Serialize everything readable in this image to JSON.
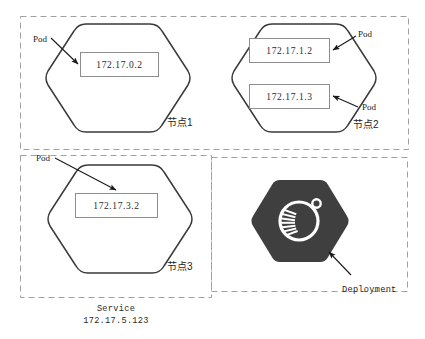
{
  "figure": {
    "title_clipped": "",
    "background_color": "#ffffff"
  },
  "groups": {
    "nodes_group": {
      "name": "nodes-dashed-region",
      "border_color": "#9a9a9a",
      "style": "dashed"
    },
    "service_group": {
      "name": "service-dashed-region",
      "label_line1": "Service",
      "label_line2": "172.17.5.123",
      "border_color": "#9a9a9a",
      "style": "dashed"
    },
    "deployment_group": {
      "name": "deployment-dashed-region",
      "border_color": "#9a9a9a",
      "style": "dashed"
    }
  },
  "nodes": [
    {
      "id": "node1",
      "label": "节点1",
      "pods": [
        {
          "ip": "172.17.0.2",
          "callout": "Pod"
        }
      ]
    },
    {
      "id": "node2",
      "label": "节点2",
      "pods": [
        {
          "ip": "172.17.1.2",
          "callout": "Pod"
        },
        {
          "ip": "172.17.1.3",
          "callout": "Pod"
        }
      ]
    },
    {
      "id": "node3",
      "label": "节点3",
      "pods": [
        {
          "ip": "172.17.3.2",
          "callout": "Pod"
        }
      ]
    }
  ],
  "deployment": {
    "label": "Deployment",
    "icon": "deployment-hexagon-icon",
    "hex_fill": "#3f3f3f",
    "glyph_color": "#ffffff"
  },
  "colors": {
    "hex_stroke": "#3a3a3a",
    "box_stroke": "#8d8d8d",
    "dashed_stroke": "#a0a0a0",
    "arrow": "#1a1a1a",
    "text": "#222222"
  }
}
